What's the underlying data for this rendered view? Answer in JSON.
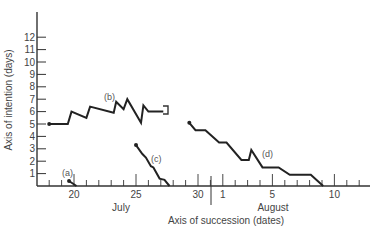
{
  "chart_data": {
    "type": "line",
    "title": "",
    "xlabel": "Axis of succession (dates)",
    "ylabel": "Axis of intention (days)",
    "ylim": [
      0,
      12
    ],
    "yticks": [
      1,
      2,
      3,
      4,
      5,
      6,
      7,
      8,
      9,
      10,
      11,
      12
    ],
    "x_tick_labels": [
      {
        "label": "20",
        "day": 20
      },
      {
        "label": "25",
        "day": 25
      },
      {
        "label": "30",
        "day": 30
      },
      {
        "label": "1",
        "day": 32
      },
      {
        "label": "5",
        "day": 36
      },
      {
        "label": "10",
        "day": 41
      }
    ],
    "month_labels": [
      {
        "label": "July",
        "day": 24.5
      },
      {
        "label": "August",
        "day": 36
      }
    ],
    "grid": false,
    "series": [
      {
        "name": "(a)",
        "points": [
          [
            19.6,
            0.4
          ],
          [
            20.2,
            0.0
          ]
        ]
      },
      {
        "name": "(b)",
        "points": [
          [
            18,
            5.0
          ],
          [
            19.5,
            5.0
          ],
          [
            19.8,
            6.0
          ],
          [
            21.0,
            5.5
          ],
          [
            21.3,
            6.4
          ],
          [
            23.2,
            5.9
          ],
          [
            23.4,
            6.8
          ],
          [
            24.0,
            6.2
          ],
          [
            24.3,
            7.0
          ],
          [
            25.4,
            5.1
          ],
          [
            25.6,
            6.5
          ],
          [
            26.0,
            6.0
          ],
          [
            27.2,
            6.0
          ]
        ]
      },
      {
        "name": "(c)",
        "points": [
          [
            25.0,
            3.3
          ],
          [
            25.5,
            2.6
          ],
          [
            25.8,
            2.3
          ],
          [
            26.2,
            1.6
          ],
          [
            26.4,
            1.5
          ],
          [
            26.9,
            0.6
          ],
          [
            27.3,
            0.5
          ],
          [
            27.7,
            0.0
          ]
        ]
      },
      {
        "name": "(d)",
        "points": [
          [
            29.3,
            5.1
          ],
          [
            29.8,
            4.5
          ],
          [
            30.6,
            4.5
          ],
          [
            31.7,
            3.5
          ],
          [
            32.3,
            3.5
          ],
          [
            33.5,
            2.1
          ],
          [
            34.1,
            2.1
          ],
          [
            34.3,
            2.9
          ],
          [
            35.2,
            1.5
          ],
          [
            36.5,
            1.5
          ],
          [
            37.4,
            0.9
          ],
          [
            39.1,
            0.9
          ],
          [
            40.1,
            0.0
          ]
        ]
      }
    ]
  },
  "labels": {
    "y_axis_title": "Axis of intention (days)",
    "x_axis_title": "Axis of succession (dates)",
    "month_july": "July",
    "month_august": "August",
    "series_a": "(a)",
    "series_b": "(b)",
    "series_c": "(c)",
    "series_d": "(d)",
    "x_ticks": [
      "20",
      "25",
      "30",
      "1",
      "5",
      "10"
    ],
    "y_ticks": [
      "1",
      "2",
      "3",
      "4",
      "5",
      "6",
      "7",
      "8",
      "9",
      "10",
      "11",
      "12"
    ]
  }
}
